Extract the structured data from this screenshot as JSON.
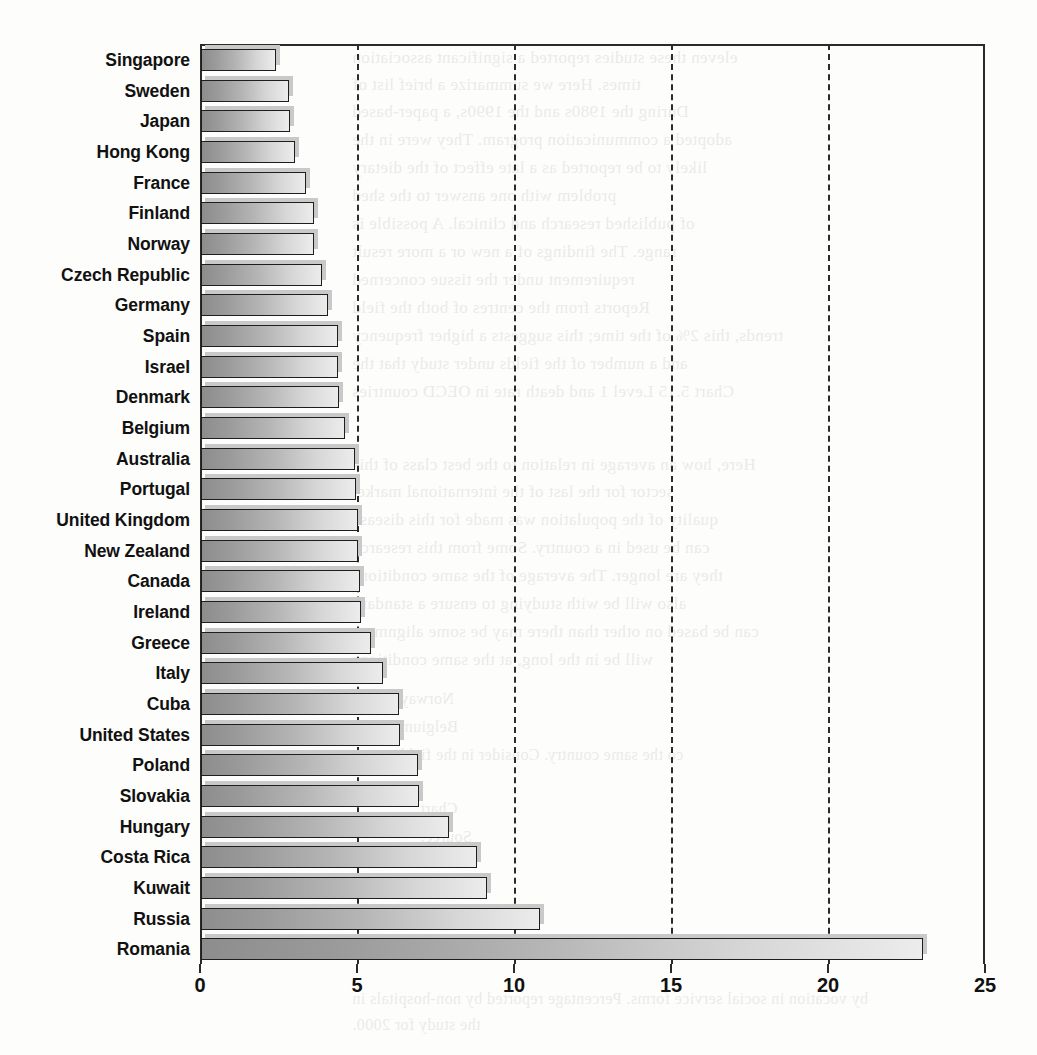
{
  "chart_data": {
    "type": "bar",
    "orientation": "horizontal",
    "title": "",
    "subtitle": "",
    "xlabel": "",
    "ylabel": "",
    "xlim": [
      0,
      25
    ],
    "xticks": [
      0,
      5,
      10,
      15,
      20,
      25
    ],
    "xtick_labels": [
      "0",
      "5",
      "10",
      "15",
      "20",
      "25"
    ],
    "gridlines": [
      5,
      10,
      15,
      20
    ],
    "grid": true,
    "legend": null,
    "categories": [
      "Singapore",
      "Sweden",
      "Japan",
      "Hong Kong",
      "France",
      "Finland",
      "Norway",
      "Czech Republic",
      "Germany",
      "Spain",
      "Israel",
      "Denmark",
      "Belgium",
      "Australia",
      "Portugal",
      "United Kingdom",
      "New Zealand",
      "Canada",
      "Ireland",
      "Greece",
      "Italy",
      "Cuba",
      "United States",
      "Poland",
      "Slovakia",
      "Hungary",
      "Costa Rica",
      "Kuwait",
      "Russia",
      "Romania"
    ],
    "values": [
      2.4,
      2.8,
      2.85,
      3.0,
      3.35,
      3.6,
      3.6,
      3.85,
      4.05,
      4.35,
      4.35,
      4.4,
      4.6,
      4.9,
      4.95,
      5.0,
      5.0,
      5.05,
      5.1,
      5.4,
      5.8,
      6.3,
      6.35,
      6.9,
      6.95,
      7.9,
      8.8,
      9.1,
      10.8,
      23.0
    ]
  },
  "style": {
    "bar_fill_dark": "#8d8d8d",
    "bar_fill_light": "#ececec",
    "bar_border": "#1e1e1e",
    "axis_color": "#2b2b2b",
    "label_color": "#111111",
    "page_background": "#fdfdfb"
  },
  "bleed_text": [
    {
      "x": 352,
      "y": 48,
      "size": 17,
      "text": "eleven these studies reported a significant association"
    },
    {
      "x": 352,
      "y": 75,
      "size": 17,
      "text": "times. Here we summarize a brief list of"
    },
    {
      "x": 352,
      "y": 102,
      "size": 17,
      "text": "During the 1980s and the 1990s, a paper-based"
    },
    {
      "x": 352,
      "y": 130,
      "size": 17,
      "text": "adopted a communication program. They were in the"
    },
    {
      "x": 352,
      "y": 158,
      "size": 17,
      "text": "likely to be reported as a late effect of the dietary"
    },
    {
      "x": 352,
      "y": 186,
      "size": 17,
      "text": "problem with one answer to the shed"
    },
    {
      "x": 352,
      "y": 214,
      "size": 17,
      "text": "of published research and clinical. A possible is"
    },
    {
      "x": 352,
      "y": 242,
      "size": 17,
      "text": "range. The findings of a new or a more result"
    },
    {
      "x": 352,
      "y": 270,
      "size": 17,
      "text": "requirement under the tissue concerned"
    },
    {
      "x": 352,
      "y": 298,
      "size": 17,
      "text": "Reports from the centres of both the field"
    },
    {
      "x": 352,
      "y": 326,
      "size": 17,
      "text": "trends, this 2% of the time; this suggests a higher frequency"
    },
    {
      "x": 352,
      "y": 354,
      "size": 17,
      "text": "and a number of the fields under study that the"
    },
    {
      "x": 352,
      "y": 382,
      "size": 17,
      "text": "Chart 5.15   Level 1 and death rate in OECD countries"
    },
    {
      "x": 352,
      "y": 455,
      "size": 17,
      "text": "Here, how an average in relation to the best class of this"
    },
    {
      "x": 352,
      "y": 482,
      "size": 17,
      "text": "sector for the last of the international market"
    },
    {
      "x": 352,
      "y": 510,
      "size": 17,
      "text": "quality of the population was made for this disease"
    },
    {
      "x": 352,
      "y": 538,
      "size": 17,
      "text": "can be used in a country. Some from this research"
    },
    {
      "x": 352,
      "y": 566,
      "size": 17,
      "text": "they are longer. The average of the same conditions"
    },
    {
      "x": 352,
      "y": 594,
      "size": 17,
      "text": "also will be with studying to ensure a standard"
    },
    {
      "x": 352,
      "y": 622,
      "size": 17,
      "text": "can be based on other than there may be some alignment"
    },
    {
      "x": 352,
      "y": 650,
      "size": 17,
      "text": "will be in the long, at the same conditions"
    },
    {
      "x": 400,
      "y": 690,
      "size": 16,
      "text": "Norway"
    },
    {
      "x": 400,
      "y": 718,
      "size": 16,
      "text": "Belgium"
    },
    {
      "x": 400,
      "y": 746,
      "size": 16,
      "text": "co the same country. Consider in the field"
    },
    {
      "x": 420,
      "y": 800,
      "size": 16,
      "text": "Chart"
    },
    {
      "x": 420,
      "y": 828,
      "size": 16,
      "text": "Source:"
    },
    {
      "x": 352,
      "y": 990,
      "size": 16,
      "text": "by vocation in social service forms. Percentage reported by non-hospitals in"
    },
    {
      "x": 352,
      "y": 1016,
      "size": 16,
      "text": "the study for 2000."
    }
  ]
}
